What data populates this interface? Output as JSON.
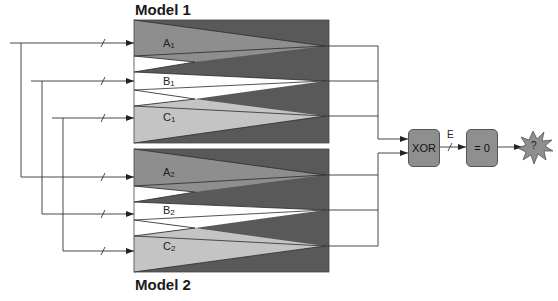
{
  "diagram": {
    "models": [
      {
        "title": "Model 1",
        "channels": [
          {
            "letter": "A",
            "index": "1"
          },
          {
            "letter": "B",
            "index": "1"
          },
          {
            "letter": "C",
            "index": "1"
          }
        ]
      },
      {
        "title": "Model 2",
        "channels": [
          {
            "letter": "A",
            "index": "2"
          },
          {
            "letter": "B",
            "index": "2"
          },
          {
            "letter": "C",
            "index": "2"
          }
        ]
      }
    ],
    "xor_label": "XOR",
    "bus_label": "E",
    "compare_label": "= 0",
    "result_label": "?",
    "colors": {
      "dark": "#595959",
      "mid": "#8e8e8e",
      "light": "#c4c4c4",
      "white": "#ffffff",
      "line": "#3a3a3a"
    }
  }
}
